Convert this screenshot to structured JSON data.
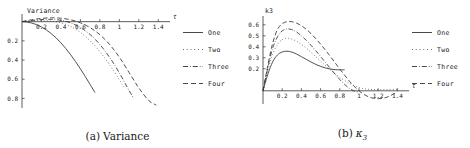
{
  "figure": {
    "panels": [
      {
        "id": "variance",
        "caption_number": "(a)",
        "caption_text": "Variance",
        "axis_label_y": "Variance",
        "axis_label_x": "t"
      },
      {
        "id": "kappa3",
        "caption_number": "(b)",
        "caption_text": "κ3",
        "axis_label_y": "k3",
        "axis_label_x": "t"
      }
    ],
    "legend": {
      "entries": [
        {
          "label": "One",
          "style": "solid"
        },
        {
          "label": "Two",
          "style": "dotted"
        },
        {
          "label": "Three",
          "style": "dashdot"
        },
        {
          "label": "Four",
          "style": "dashed"
        }
      ]
    }
  },
  "chart_data": [
    {
      "type": "line",
      "id": "variance",
      "title": "Variance",
      "xlabel": "t",
      "ylabel": "Variance",
      "xlim": [
        0,
        1.5
      ],
      "ylim": [
        -0.9,
        0.08
      ],
      "xticks": [
        "0.2",
        "0.4",
        "0.6",
        "0.8",
        "1",
        "1.2",
        "1.4"
      ],
      "xtick_values": [
        0.2,
        0.4,
        0.6,
        0.8,
        1.0,
        1.2,
        1.4
      ],
      "yticks": [
        "-0.8",
        "-0.6",
        "-0.4",
        "-0.2"
      ],
      "ytick_values": [
        -0.8,
        -0.6,
        -0.4,
        -0.2
      ],
      "ytick_labels_shown": [
        "0.8",
        "0.6",
        "0.4",
        "0.2"
      ],
      "grid": false,
      "legend_position": "right",
      "series": [
        {
          "name": "One",
          "style": "solid",
          "x": [
            0.0,
            0.05,
            0.1,
            0.15,
            0.2,
            0.25,
            0.3,
            0.35,
            0.4,
            0.45,
            0.5,
            0.55,
            0.6,
            0.65,
            0.7,
            0.75
          ],
          "y": [
            0.0,
            -0.004,
            -0.014,
            -0.031,
            -0.055,
            -0.086,
            -0.124,
            -0.169,
            -0.221,
            -0.28,
            -0.345,
            -0.416,
            -0.492,
            -0.572,
            -0.655,
            -0.74
          ]
        },
        {
          "name": "Two",
          "style": "dotted",
          "x": [
            0.0,
            0.1,
            0.2,
            0.3,
            0.4,
            0.5,
            0.6,
            0.7,
            0.8,
            0.9,
            1.0,
            1.05
          ],
          "y": [
            0.0,
            0.006,
            0.01,
            0.006,
            -0.012,
            -0.05,
            -0.112,
            -0.2,
            -0.313,
            -0.45,
            -0.606,
            -0.69
          ]
        },
        {
          "name": "Three",
          "style": "dashdot",
          "x": [
            0.0,
            0.1,
            0.2,
            0.3,
            0.4,
            0.5,
            0.6,
            0.7,
            0.8,
            0.9,
            1.0,
            1.1,
            1.15
          ],
          "y": [
            0.0,
            0.012,
            0.022,
            0.024,
            0.014,
            -0.012,
            -0.06,
            -0.134,
            -0.238,
            -0.372,
            -0.534,
            -0.718,
            -0.8
          ]
        },
        {
          "name": "Four",
          "style": "dashed",
          "x": [
            0.0,
            0.1,
            0.2,
            0.3,
            0.4,
            0.5,
            0.6,
            0.7,
            0.8,
            0.9,
            1.0,
            1.1,
            1.2,
            1.3,
            1.38
          ],
          "y": [
            0.0,
            0.02,
            0.034,
            0.04,
            0.036,
            0.02,
            -0.012,
            -0.062,
            -0.136,
            -0.238,
            -0.37,
            -0.53,
            -0.69,
            -0.82,
            -0.87
          ]
        }
      ]
    },
    {
      "type": "line",
      "id": "kappa3",
      "title": "k3",
      "xlabel": "t",
      "ylabel": "k3",
      "xlim": [
        0,
        1.5
      ],
      "ylim": [
        -0.12,
        0.68
      ],
      "xticks": [
        "0.2",
        "0.4",
        "0.6",
        "0.8",
        "1",
        "1.2",
        "1.4"
      ],
      "xtick_values": [
        0.2,
        0.4,
        0.6,
        0.8,
        1.0,
        1.2,
        1.4
      ],
      "yticks": [
        "0.2",
        "0.3",
        "0.4",
        "0.5",
        "0.6"
      ],
      "ytick_values": [
        0.2,
        0.3,
        0.4,
        0.5,
        0.6
      ],
      "grid": false,
      "legend_position": "right",
      "series": [
        {
          "name": "One",
          "style": "solid",
          "x": [
            0.0,
            0.05,
            0.1,
            0.15,
            0.2,
            0.25,
            0.3,
            0.35,
            0.4,
            0.45,
            0.5,
            0.55,
            0.6,
            0.65,
            0.7,
            0.75,
            0.8,
            0.85
          ],
          "y": [
            0.0,
            0.15,
            0.262,
            0.325,
            0.353,
            0.36,
            0.352,
            0.334,
            0.31,
            0.286,
            0.262,
            0.24,
            0.222,
            0.208,
            0.198,
            0.192,
            0.19,
            0.192
          ]
        },
        {
          "name": "Two",
          "style": "dotted",
          "x": [
            0.0,
            0.05,
            0.1,
            0.15,
            0.2,
            0.25,
            0.3,
            0.35,
            0.4,
            0.45,
            0.5,
            0.55,
            0.6,
            0.65,
            0.7,
            0.75,
            0.8,
            0.9,
            1.0,
            1.1,
            1.2,
            1.3,
            1.4
          ],
          "y": [
            0.0,
            0.185,
            0.33,
            0.42,
            0.465,
            0.478,
            0.47,
            0.45,
            0.422,
            0.388,
            0.35,
            0.31,
            0.27,
            0.23,
            0.192,
            0.155,
            0.122,
            0.068,
            0.03,
            0.014,
            0.01,
            0.012,
            0.014
          ]
        },
        {
          "name": "Three",
          "style": "dashdot",
          "x": [
            0.0,
            0.05,
            0.1,
            0.15,
            0.2,
            0.25,
            0.3,
            0.35,
            0.4,
            0.45,
            0.5,
            0.55,
            0.6,
            0.65,
            0.7,
            0.75,
            0.8,
            0.85,
            0.9,
            0.95,
            1.0
          ],
          "y": [
            0.0,
            0.21,
            0.385,
            0.49,
            0.545,
            0.562,
            0.556,
            0.534,
            0.5,
            0.46,
            0.414,
            0.364,
            0.312,
            0.258,
            0.205,
            0.152,
            0.102,
            0.058,
            0.022,
            -0.002,
            -0.012
          ]
        },
        {
          "name": "Four",
          "style": "dashed",
          "x": [
            0.0,
            0.05,
            0.1,
            0.15,
            0.2,
            0.25,
            0.3,
            0.35,
            0.4,
            0.45,
            0.5,
            0.55,
            0.6,
            0.65,
            0.7,
            0.75,
            0.8,
            0.85,
            0.9,
            0.95,
            1.0,
            1.05,
            1.1,
            1.15,
            1.2,
            1.25,
            1.3,
            1.35,
            1.4
          ],
          "y": [
            0.0,
            0.23,
            0.43,
            0.556,
            0.61,
            0.628,
            0.628,
            0.615,
            0.592,
            0.56,
            0.52,
            0.474,
            0.424,
            0.37,
            0.314,
            0.256,
            0.198,
            0.142,
            0.088,
            0.04,
            0.0,
            -0.032,
            -0.055,
            -0.068,
            -0.072,
            -0.068,
            -0.055,
            -0.034,
            -0.008
          ]
        }
      ]
    }
  ]
}
